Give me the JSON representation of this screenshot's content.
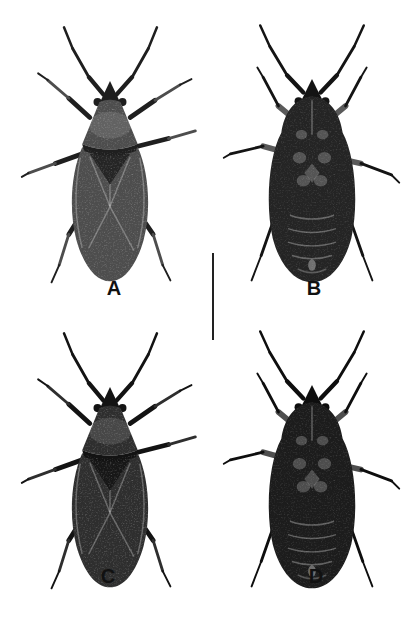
{
  "figure": {
    "type": "specimen-plate",
    "panels": [
      {
        "id": "A",
        "label": "A",
        "view": "dorsal"
      },
      {
        "id": "B",
        "label": "B",
        "view": "ventral"
      },
      {
        "id": "C",
        "label": "C",
        "view": "dorsal"
      },
      {
        "id": "D",
        "label": "D",
        "view": "ventral"
      }
    ],
    "scale_bar": {
      "orientation": "vertical"
    },
    "colors": {
      "background": "#ffffff",
      "label": "#111111",
      "scale-bar": "#222222",
      "body-a": "#4d4d4d",
      "dark-a": "#1f1f1f",
      "light-a": "#6e6e6e",
      "body-b": "#242424",
      "dark-b": "#141414",
      "light-b": "#5a5a5a",
      "body-c": "#2e2e2e",
      "dark-c": "#131313",
      "light-c": "#565656",
      "body-d": "#1c1c1c",
      "dark-d": "#0e0e0e",
      "light-d": "#4e4e4e"
    }
  }
}
